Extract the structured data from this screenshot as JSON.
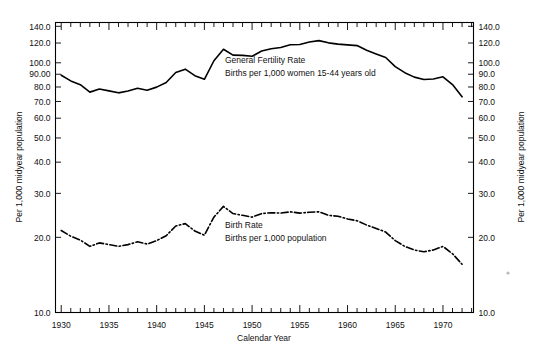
{
  "chart_data": {
    "type": "line",
    "title": "",
    "xlabel": "Calendar Year",
    "ylabel_left": "Per 1,000 midyear population",
    "ylabel_right": "Per 1,000 midyear population",
    "scale": "log",
    "grid": false,
    "xlim": [
      1929.4,
      1973.2
    ],
    "ylim": [
      10,
      145
    ],
    "xticks_major": [
      1930,
      1935,
      1940,
      1945,
      1950,
      1955,
      1960,
      1965,
      1970
    ],
    "xticklabels": [
      "1930",
      "1935",
      "1940",
      "1945",
      "1950",
      "1955",
      "1960",
      "1965",
      "1970"
    ],
    "xtick_minor_step": 1,
    "yticks": [
      140,
      120,
      100,
      90,
      80,
      70,
      60,
      50,
      40,
      30,
      20,
      10
    ],
    "yticklabels_left": [
      "140.0",
      "120.0",
      "100.0",
      "90.00",
      "80.0",
      "70.0",
      "60.0",
      "50.0",
      "40.0",
      "30.0",
      "20.0",
      "10.0"
    ],
    "yticklabels_right": [
      "140.0",
      "120.0",
      "100.0",
      "90.0",
      "80.0",
      "70.0",
      "60.0",
      "50.0",
      "40.0",
      "30.0",
      "20.0",
      "10.0"
    ],
    "legend_position": "inline-annotation",
    "x": [
      1930,
      1931,
      1932,
      1933,
      1934,
      1935,
      1936,
      1937,
      1938,
      1939,
      1940,
      1941,
      1942,
      1943,
      1944,
      1945,
      1946,
      1947,
      1948,
      1949,
      1950,
      1951,
      1952,
      1953,
      1954,
      1955,
      1956,
      1957,
      1958,
      1959,
      1960,
      1961,
      1962,
      1963,
      1964,
      1965,
      1966,
      1967,
      1968,
      1969,
      1970,
      1971,
      1972
    ],
    "series": [
      {
        "name": "General Fertility Rate",
        "style": "solid",
        "annotation_line1": "General Fertility Rate",
        "annotation_line2": "Births per 1,000 women 15-44 years old",
        "values": [
          89.2,
          84.6,
          81.7,
          76.3,
          78.5,
          77.2,
          75.8,
          77.1,
          79.1,
          77.6,
          79.9,
          83.4,
          91.5,
          94.3,
          88.8,
          85.9,
          101.9,
          113.3,
          107.3,
          107.1,
          106.2,
          111.5,
          113.9,
          115.2,
          118.1,
          118.3,
          121.2,
          122.7,
          120.2,
          118.8,
          118.0,
          117.2,
          112.2,
          108.5,
          105.0,
          96.6,
          91.3,
          87.6,
          85.7,
          86.1,
          87.9,
          81.8,
          73.1
        ]
      },
      {
        "name": "Birth Rate",
        "style": "dash-dot",
        "annotation_line1": "Birth Rate",
        "annotation_line2": "Births per 1,000 population",
        "values": [
          21.3,
          20.2,
          19.5,
          18.4,
          19.0,
          18.7,
          18.4,
          18.7,
          19.2,
          18.8,
          19.4,
          20.3,
          22.2,
          22.7,
          21.2,
          20.4,
          24.1,
          26.6,
          24.9,
          24.5,
          24.1,
          24.9,
          25.1,
          25.0,
          25.3,
          25.0,
          25.2,
          25.3,
          24.5,
          24.3,
          23.7,
          23.3,
          22.4,
          21.7,
          21.0,
          19.4,
          18.4,
          17.8,
          17.5,
          17.8,
          18.4,
          17.2,
          15.6
        ]
      }
    ]
  },
  "annotations": {
    "gfr": {
      "line1": "General Fertility Rate",
      "line2": "Births per 1,000 women 15-44 years old"
    },
    "birth": {
      "line1": "Birth Rate",
      "line2": "Births per 1,000 population"
    }
  },
  "axes": {
    "x_title": "Calendar Year",
    "y_left_title": "Per 1,000 midyear population",
    "y_right_title": "Per 1,000 midyear population"
  },
  "colors": {
    "ink": "#000000",
    "background": "#ffffff"
  }
}
